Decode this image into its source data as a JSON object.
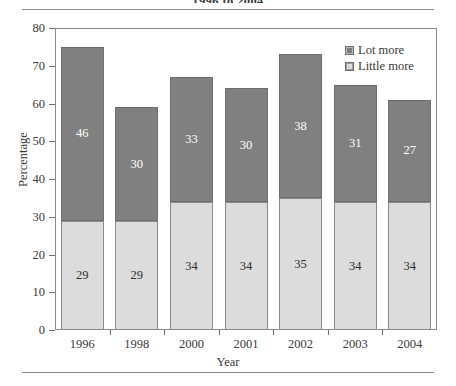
{
  "figure": {
    "clipped_caption": "1996 to 2004"
  },
  "chart_data": {
    "type": "bar",
    "stacked": true,
    "title": "",
    "xlabel": "Year",
    "ylabel": "Percentage",
    "ylim": [
      0,
      80
    ],
    "ytick_step": 10,
    "yticks": [
      0,
      10,
      20,
      30,
      40,
      50,
      60,
      70,
      80
    ],
    "grid": false,
    "legend_position": "top-right-inside",
    "categories": [
      "1996",
      "1998",
      "2000",
      "2001",
      "2002",
      "2003",
      "2004"
    ],
    "series": [
      {
        "name": "Lot more",
        "color": "#808080",
        "values": [
          46,
          30,
          33,
          30,
          38,
          31,
          27
        ]
      },
      {
        "name": "Little more",
        "color": "#dcdcdc",
        "values": [
          29,
          29,
          34,
          34,
          35,
          34,
          34
        ]
      }
    ],
    "totals": [
      75,
      59,
      67,
      64,
      73,
      65,
      61
    ]
  }
}
